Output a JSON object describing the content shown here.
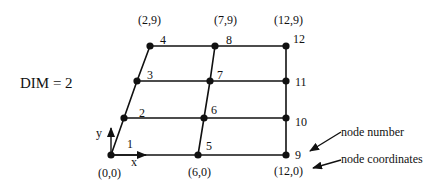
{
  "title": "DIM = 2",
  "nodes": [
    {
      "id": "1",
      "x": 111,
      "y": 155
    },
    {
      "id": "2",
      "x": 124,
      "y": 118
    },
    {
      "id": "3",
      "x": 137,
      "y": 81
    },
    {
      "id": "4",
      "x": 150,
      "y": 46
    },
    {
      "id": "5",
      "x": 198,
      "y": 155
    },
    {
      "id": "6",
      "x": 204,
      "y": 118
    },
    {
      "id": "7",
      "x": 210,
      "y": 81
    },
    {
      "id": "8",
      "x": 215,
      "y": 46
    },
    {
      "id": "9",
      "x": 286,
      "y": 155
    },
    {
      "id": "10",
      "x": 286,
      "y": 118
    },
    {
      "id": "11",
      "x": 286,
      "y": 81
    },
    {
      "id": "12",
      "x": 286,
      "y": 46
    }
  ],
  "coordinates": {
    "n1": "(0,0)",
    "n5": "(6,0)",
    "n9": "(12,0)",
    "n4": "(2,9)",
    "n8": "(7,9)",
    "n12": "(12,9)"
  },
  "axes": {
    "x": "x",
    "y": "y"
  },
  "annotations": {
    "node_number": "node number",
    "node_coordinates": "node coordinates"
  },
  "colors": {
    "line": "#111111",
    "background": "#ffffff"
  }
}
